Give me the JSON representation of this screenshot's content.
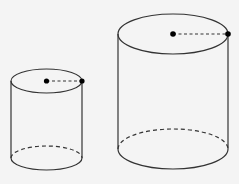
{
  "diagram": {
    "colors": {
      "background": "#f4f4f4",
      "stroke": "#333333",
      "point": "#000000"
    },
    "cylinders": [
      {
        "name": "small",
        "cx": 46.5,
        "top_cy": 81,
        "rx": 35.5,
        "ry": 12,
        "bottom_cy": 158
      },
      {
        "name": "large",
        "cx": 173,
        "top_cy": 34,
        "rx": 55,
        "ry": 20,
        "bottom_cy": 149
      }
    ]
  }
}
